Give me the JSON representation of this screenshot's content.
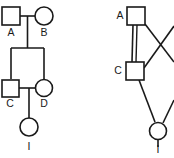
{
  "figure": {
    "kind": "two-panel-diagram",
    "background_color": "#ffffff",
    "stroke_color": "#1a1a1a",
    "width": 174,
    "height": 158
  },
  "left_panel": {
    "name": "pedigree-chart",
    "nodes": [
      {
        "id": "A",
        "label": "A",
        "shape": "square",
        "sex": "male",
        "x": 11,
        "y": 16,
        "size": 18,
        "label_x": 11,
        "label_y": 33
      },
      {
        "id": "B",
        "label": "B",
        "shape": "circle",
        "sex": "female",
        "x": 44,
        "y": 16,
        "size": 18,
        "label_x": 44,
        "label_y": 33
      },
      {
        "id": "C",
        "label": "C",
        "shape": "square",
        "sex": "male",
        "x": 10,
        "y": 88,
        "size": 17,
        "label_x": 10,
        "label_y": 104
      },
      {
        "id": "D",
        "label": "D",
        "shape": "circle",
        "sex": "female",
        "x": 44,
        "y": 88,
        "size": 17,
        "label_x": 44,
        "label_y": 104
      },
      {
        "id": "I",
        "label": "I",
        "shape": "circle",
        "sex": "female",
        "x": 29,
        "y": 127,
        "size": 18,
        "label_x": 29,
        "label_y": 146
      }
    ],
    "connections": [
      {
        "type": "mating-line",
        "from": "A",
        "to": "B"
      },
      {
        "type": "descent-line",
        "from": "A-B",
        "to": "C-D"
      },
      {
        "type": "mating-line",
        "from": "C",
        "to": "D"
      },
      {
        "type": "descent-line",
        "from": "C-D",
        "to": "I"
      }
    ]
  },
  "right_panel": {
    "name": "graph-diagram",
    "clipped_at_right_edge": true,
    "nodes": [
      {
        "id": "A",
        "label": "A",
        "shape": "square",
        "x": 136,
        "y": 16,
        "size": 18,
        "label_x": 117,
        "label_y": 16
      },
      {
        "id": "C",
        "label": "C",
        "shape": "square",
        "x": 135,
        "y": 71,
        "size": 18,
        "label_x": 116,
        "label_y": 71
      },
      {
        "id": "I",
        "label": "I",
        "shape": "circle",
        "x": 158,
        "y": 130,
        "size": 17,
        "label_x": 158,
        "label_y": 149
      }
    ],
    "edges": [
      {
        "from": "A",
        "to": "C",
        "style": "vertical"
      },
      {
        "from": "A",
        "to": "offscreen-lower-right",
        "style": "diagonal"
      },
      {
        "from": "C",
        "to": "offscreen-upper-right",
        "style": "diagonal"
      },
      {
        "from": "C",
        "to": "I",
        "style": "diagonal"
      },
      {
        "from": "I",
        "to": "offscreen-upper-right",
        "style": "diagonal"
      }
    ]
  }
}
